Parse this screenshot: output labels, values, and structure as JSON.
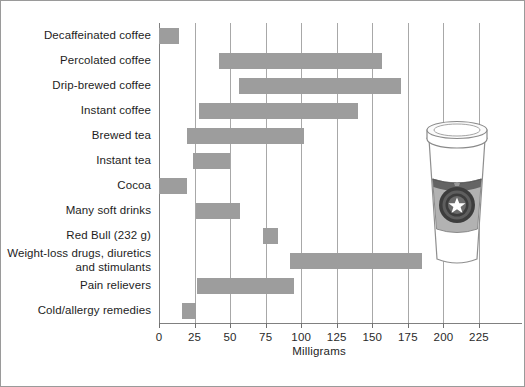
{
  "chart_data": {
    "type": "bar",
    "orientation": "horizontal",
    "subtype": "range-bar",
    "title": "",
    "xlabel": "Milligrams",
    "ylabel": "",
    "xlim": [
      0,
      225
    ],
    "xticks": [
      0,
      25,
      50,
      75,
      100,
      125,
      150,
      175,
      200,
      225
    ],
    "xtick_labels": [
      "0",
      "25",
      "50",
      "75",
      "100",
      "125",
      "150",
      "175",
      "200",
      "225"
    ],
    "grid": true,
    "grid_axis": "x",
    "legend": null,
    "bar_color": "#9d9d9d",
    "categories": [
      "Decaffeinated coffee",
      "Percolated coffee",
      "Drip-brewed coffee",
      "Instant coffee",
      "Brewed tea",
      "Instant tea",
      "Cocoa",
      "Many soft drinks",
      "Red Bull (232 g)",
      "Weight-loss drugs, diuretics\nand stimulants",
      "Pain relievers",
      "Cold/allergy remedies"
    ],
    "ranges": [
      {
        "label": "Decaffeinated coffee",
        "low": 0,
        "high": 14
      },
      {
        "label": "Percolated coffee",
        "low": 42,
        "high": 157
      },
      {
        "label": "Drip-brewed coffee",
        "low": 56,
        "high": 170
      },
      {
        "label": "Instant coffee",
        "low": 28,
        "high": 140
      },
      {
        "label": "Brewed tea",
        "low": 20,
        "high": 102
      },
      {
        "label": "Instant tea",
        "low": 24,
        "high": 50
      },
      {
        "label": "Cocoa",
        "low": 0,
        "high": 20
      },
      {
        "label": "Many soft drinks",
        "low": 26,
        "high": 57
      },
      {
        "label": "Red Bull (232 g)",
        "low": 73,
        "high": 84
      },
      {
        "label": "Weight-loss drugs, diuretics and stimulants",
        "low": 92,
        "high": 185
      },
      {
        "label": "Pain relievers",
        "low": 27,
        "high": 95
      },
      {
        "label": "Cold/allergy remedies",
        "low": 16,
        "high": 26
      }
    ]
  },
  "illustration": {
    "name": "coffee-cup",
    "description": "disposable coffee cup with lid, sleeve and star logo"
  }
}
